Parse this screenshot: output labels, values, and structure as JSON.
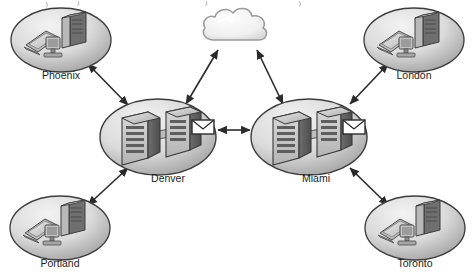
{
  "diagram": {
    "title_partial": "a distributed replication topology diagram",
    "background_color": "#ffffff",
    "ellipse_fill_light": "#eceaea",
    "ellipse_fill_dark": "#9a9a9a",
    "ellipse_stroke": "#3c3c3c",
    "arrow_color": "#2b2b2b",
    "label_color": "#1c1c1c",
    "cloud_fill": "#f2f2f2",
    "cloud_stroke": "#9b9b9b"
  },
  "cloud": {
    "name": "internet-cloud",
    "cx": 238,
    "cy": 31
  },
  "sites": [
    {
      "id": "phoenix",
      "label": "Phoenix",
      "type": "workstation-site",
      "cx": 61,
      "cy": 40,
      "rx": 50,
      "ry": 32,
      "label_y": 68,
      "devices": [
        "laptop",
        "desktop-monitor",
        "tower-pc"
      ]
    },
    {
      "id": "london",
      "label": "London",
      "type": "workstation-site",
      "cx": 414,
      "cy": 40,
      "rx": 50,
      "ry": 32,
      "label_y": 68,
      "devices": [
        "laptop",
        "desktop-monitor",
        "tower-pc"
      ]
    },
    {
      "id": "denver",
      "label": "Denver",
      "type": "server-site",
      "cx": 158,
      "cy": 137,
      "rx": 58,
      "ry": 38,
      "label_y": 170,
      "devices": [
        "server-rack",
        "server-rack",
        "mail-envelope"
      ]
    },
    {
      "id": "miami",
      "label": "Miami",
      "type": "server-site",
      "cx": 309,
      "cy": 137,
      "rx": 58,
      "ry": 38,
      "label_y": 170,
      "devices": [
        "server-rack",
        "server-rack",
        "mail-envelope"
      ]
    },
    {
      "id": "portland",
      "label": "Portland",
      "type": "workstation-site",
      "cx": 60,
      "cy": 228,
      "rx": 50,
      "ry": 32,
      "label_y": 256,
      "devices": [
        "laptop",
        "desktop-monitor",
        "tower-pc"
      ]
    },
    {
      "id": "toronto",
      "label": "Toronto",
      "type": "workstation-site",
      "cx": 415,
      "cy": 228,
      "rx": 50,
      "ry": 32,
      "label_y": 256,
      "devices": [
        "laptop",
        "desktop-monitor",
        "tower-pc"
      ]
    }
  ],
  "links": [
    {
      "id": "phoenix-denver",
      "from": "phoenix",
      "to": "denver",
      "arrows": "both"
    },
    {
      "id": "portland-denver",
      "from": "portland",
      "to": "denver",
      "arrows": "both"
    },
    {
      "id": "denver-cloud",
      "from": "denver",
      "to": "cloud",
      "arrows": "both"
    },
    {
      "id": "miami-cloud",
      "from": "miami",
      "to": "cloud",
      "arrows": "both"
    },
    {
      "id": "denver-miami",
      "from": "denver",
      "to": "miami",
      "arrows": "both"
    },
    {
      "id": "miami-london",
      "from": "miami",
      "to": "london",
      "arrows": "both"
    },
    {
      "id": "miami-toronto",
      "from": "miami",
      "to": "toronto",
      "arrows": "both"
    }
  ]
}
